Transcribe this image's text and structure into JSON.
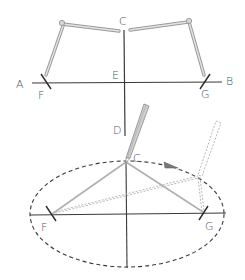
{
  "figure": {
    "type": "geometric construction",
    "colors": {
      "line": "#3a3a3a",
      "string": "#b5b5b5",
      "label": "#555555",
      "background": "#ffffff"
    }
  },
  "top_panel": {
    "labels": {
      "A": "A",
      "B": "B",
      "C": "C",
      "D": "D",
      "E": "E",
      "F": "F",
      "G": "G"
    }
  },
  "bottom_panel": {
    "labels": {
      "C": "C",
      "F": "F",
      "G": "G"
    },
    "arrow_direction": "clockwise"
  }
}
